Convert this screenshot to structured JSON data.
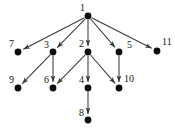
{
  "figure": {
    "background_color": "#ffffff",
    "node_color": "#0d0d0d",
    "edge_color": "#3a3a3a",
    "label_color": "#151515",
    "width": 175,
    "height": 132
  },
  "graph": {
    "type": "directed",
    "node_count": 11,
    "edge_count": 10,
    "nodes": [
      {
        "id": "1",
        "label": "1",
        "x": 88,
        "y": 16,
        "r": 3.4,
        "label_x": 80,
        "label_y": 9
      },
      {
        "id": "2",
        "label": "2",
        "x": 88,
        "y": 52,
        "r": 3.4,
        "label_x": 79,
        "label_y": 45
      },
      {
        "id": "3",
        "label": "3",
        "x": 53,
        "y": 52,
        "r": 3.4,
        "label_x": 44,
        "label_y": 46
      },
      {
        "id": "4",
        "label": "4",
        "x": 88,
        "y": 88,
        "r": 3.4,
        "label_x": 79,
        "label_y": 81
      },
      {
        "id": "5",
        "label": "5",
        "x": 119,
        "y": 52,
        "r": 3.4,
        "label_x": 127,
        "label_y": 46
      },
      {
        "id": "6",
        "label": "6",
        "x": 53,
        "y": 88,
        "r": 3.4,
        "label_x": 44,
        "label_y": 81
      },
      {
        "id": "7",
        "label": "7",
        "x": 18,
        "y": 52,
        "r": 3.4,
        "label_x": 9,
        "label_y": 45
      },
      {
        "id": "8",
        "label": "8",
        "x": 88,
        "y": 120,
        "r": 3.4,
        "label_x": 79,
        "label_y": 114
      },
      {
        "id": "9",
        "label": "9",
        "x": 18,
        "y": 88,
        "r": 3.4,
        "label_x": 9,
        "label_y": 81
      },
      {
        "id": "10",
        "label": "10",
        "x": 119,
        "y": 88,
        "r": 3.4,
        "label_x": 124,
        "label_y": 80
      },
      {
        "id": "11",
        "label": "11",
        "x": 157,
        "y": 51,
        "r": 3.4,
        "label_x": 162,
        "label_y": 43
      }
    ],
    "edges": [
      {
        "from": "1",
        "to": "7",
        "arrow": true
      },
      {
        "from": "1",
        "to": "3",
        "arrow": true
      },
      {
        "from": "1",
        "to": "2",
        "arrow": true
      },
      {
        "from": "1",
        "to": "5",
        "arrow": true
      },
      {
        "from": "1",
        "to": "11",
        "arrow": true
      },
      {
        "from": "3",
        "to": "9",
        "arrow": true
      },
      {
        "from": "3",
        "to": "6",
        "arrow": true
      },
      {
        "from": "2",
        "to": "6",
        "arrow": true
      },
      {
        "from": "2",
        "to": "4",
        "arrow": true
      },
      {
        "from": "2",
        "to": "10",
        "arrow": true
      },
      {
        "from": "5",
        "to": "10",
        "arrow": true
      },
      {
        "from": "4",
        "to": "8",
        "arrow": true
      }
    ]
  }
}
